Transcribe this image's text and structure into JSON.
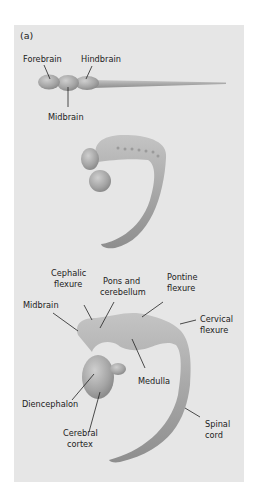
{
  "panel_label": "(a)",
  "stage1": {
    "labels": {
      "forebrain": "Forebrain",
      "hindbrain": "Hindbrain",
      "midbrain": "Midbrain"
    }
  },
  "stage3": {
    "labels": {
      "cephalic_flexure_1": "Cephalic",
      "cephalic_flexure_2": "flexure",
      "pons_1": "Pons and",
      "pons_2": "cerebellum",
      "pontine_1": "Pontine",
      "pontine_2": "flexure",
      "midbrain": "Midbrain",
      "cervical_1": "Cervical",
      "cervical_2": "flexure",
      "medulla": "Medulla",
      "diencephalon": "Diencephalon",
      "cerebral_1": "Cerebral",
      "cerebral_2": "cortex",
      "spinal_1": "Spinal",
      "spinal_2": "cord"
    }
  },
  "colors": {
    "panel_bg": "#e6e6e6",
    "tissue": "#a9a9a9",
    "tissue_light": "#c8c8c8",
    "tissue_dark": "#8a8a8a"
  }
}
